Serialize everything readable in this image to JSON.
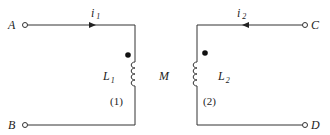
{
  "diagram": {
    "type": "coupled-inductors",
    "terminals": {
      "A": "A",
      "B": "B",
      "C": "C",
      "D": "D"
    },
    "currents": {
      "i1": {
        "symbol": "i",
        "sub": "1",
        "direction": "right"
      },
      "i2": {
        "symbol": "i",
        "sub": "2",
        "direction": "left"
      }
    },
    "inductors": {
      "L1": {
        "symbol": "L",
        "sub": "1",
        "port": "(1)"
      },
      "L2": {
        "symbol": "L",
        "sub": "2",
        "port": "(2)"
      }
    },
    "mutual": "M",
    "dots": [
      "top of L1",
      "top of L2"
    ],
    "colors": {
      "line": "#333333",
      "background": "#ffffff"
    }
  }
}
